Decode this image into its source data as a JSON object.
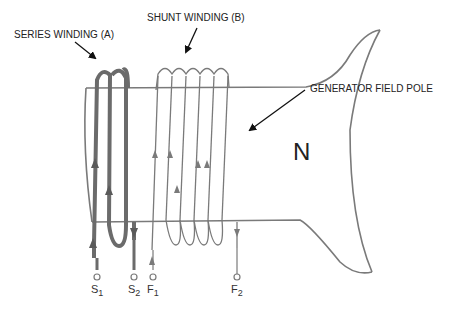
{
  "diagram": {
    "type": "generator-field-pole-windings",
    "labels": {
      "series_winding": "SERIES WINDING (A)",
      "shunt_winding": "SHUNT WINDING (B)",
      "field_pole": "GENERATOR FIELD POLE",
      "pole_polarity": "N"
    },
    "terminals": [
      {
        "id": "S1",
        "letter": "S",
        "sub": "1"
      },
      {
        "id": "S2",
        "letter": "S",
        "sub": "2"
      },
      {
        "id": "F1",
        "letter": "F",
        "sub": "1"
      },
      {
        "id": "F2",
        "letter": "F",
        "sub": "2"
      }
    ],
    "series_winding_turns": 2,
    "shunt_winding_turns": 5,
    "colors": {
      "outline": "#777777",
      "series_wire": "#6b6b6b",
      "text": "#222222"
    }
  }
}
